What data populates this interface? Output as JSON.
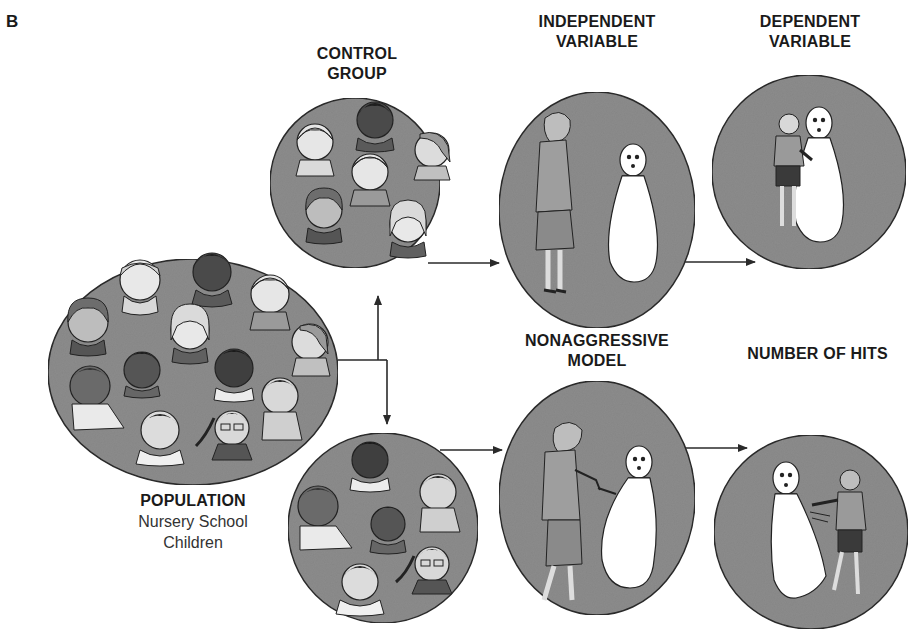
{
  "figure": {
    "panel_letter": "B",
    "colors": {
      "circle_fill": "#8c8c8c",
      "circle_stroke": "#2a2a2a",
      "arrow": "#2a2a2a",
      "bobo_fill": "#ffffff",
      "background": "#ffffff"
    }
  },
  "population": {
    "title": "POPULATION",
    "subtitle_line1": "Nursery School",
    "subtitle_line2": "Children",
    "faces_count": 13
  },
  "control_group": {
    "title": "CONTROL GROUP",
    "faces_count": 7
  },
  "experimental_group": {
    "title": "",
    "faces_count": 6
  },
  "independent_variable": {
    "title_line1": "INDEPENDENT",
    "title_line2": "VARIABLE",
    "scene": "Adult woman standing passively next to Bobo doll"
  },
  "dependent_variable": {
    "title_line1": "DEPENDENT",
    "title_line2": "VARIABLE",
    "scene": "Child hugging Bobo doll"
  },
  "nonaggressive_model": {
    "title_line1": "NONAGGRESSIVE",
    "title_line2": "MODEL",
    "scene": "Adult woman striking Bobo doll with mallet"
  },
  "number_of_hits": {
    "title": "NUMBER OF HITS",
    "scene": "Child punching Bobo doll"
  }
}
